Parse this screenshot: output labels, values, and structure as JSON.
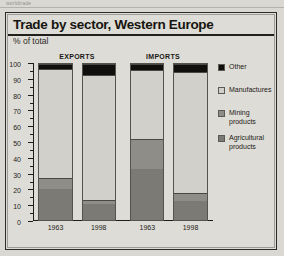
{
  "page": {
    "top_fragment": "worldtrade"
  },
  "figure": {
    "title": "Trade by sector, Western Europe",
    "subtitle": "% of total"
  },
  "groups": [
    {
      "name": "exports",
      "label": "EXPORTS"
    },
    {
      "name": "imports",
      "label": "IMPORTS"
    }
  ],
  "legend": [
    {
      "label": "Other",
      "color": "#100f0d"
    },
    {
      "label": "Manufactures",
      "color": "#d2d0ca"
    },
    {
      "label": "Mining products",
      "color": "#8f8d87"
    },
    {
      "label": "Agricultural products",
      "color": "#7c7a74"
    }
  ],
  "axis": {
    "y_labels": [
      "100",
      "90",
      "80",
      "70",
      "60",
      "50",
      "40",
      "30",
      "20",
      "10",
      "0"
    ],
    "y_label_values": [
      100,
      90,
      80,
      70,
      60,
      50,
      40,
      30,
      20,
      10,
      0
    ]
  },
  "chart_data": {
    "type": "bar",
    "subtype": "stacked-column-100",
    "title": "Trade by sector, Western Europe",
    "subtitle": "% of total",
    "xlabel": "",
    "ylabel": "% of total",
    "ylim": [
      0,
      100
    ],
    "ytick_step": 10,
    "yminor_step": 5,
    "grid": false,
    "legend_position": "right",
    "group_labels": [
      "EXPORTS",
      "IMPORTS"
    ],
    "categories": [
      "1963",
      "1998",
      "1963",
      "1998"
    ],
    "category_groups": [
      "EXPORTS",
      "EXPORTS",
      "IMPORTS",
      "IMPORTS"
    ],
    "series": [
      {
        "name": "Agricultural products",
        "color": "#7c7a74",
        "values": [
          20,
          10,
          33,
          12
        ]
      },
      {
        "name": "Mining products",
        "color": "#8f8d87",
        "values": [
          7,
          3,
          19,
          5
        ]
      },
      {
        "name": "Manufactures",
        "color": "#d2d0ca",
        "values": [
          70,
          80,
          44,
          78
        ]
      },
      {
        "name": "Other",
        "color": "#100f0d",
        "values": [
          3,
          7,
          4,
          5
        ]
      }
    ],
    "stack_order_bottom_to_top": [
      "Agricultural products",
      "Mining products",
      "Manufactures",
      "Other"
    ],
    "bars": [
      {
        "group": "EXPORTS",
        "category": "1963",
        "segments": [
          {
            "name": "Agricultural products",
            "from": 0,
            "to": 20,
            "value": 20,
            "color": "#7c7a74"
          },
          {
            "name": "Mining products",
            "from": 20,
            "to": 27,
            "value": 7,
            "color": "#8f8d87"
          },
          {
            "name": "Manufactures",
            "from": 27,
            "to": 97,
            "value": 70,
            "color": "#d2d0ca"
          },
          {
            "name": "Other",
            "from": 97,
            "to": 100,
            "value": 3,
            "color": "#100f0d"
          }
        ]
      },
      {
        "group": "EXPORTS",
        "category": "1998",
        "segments": [
          {
            "name": "Agricultural products",
            "from": 0,
            "to": 10,
            "value": 10,
            "color": "#7c7a74"
          },
          {
            "name": "Mining products",
            "from": 10,
            "to": 13,
            "value": 3,
            "color": "#8f8d87"
          },
          {
            "name": "Manufactures",
            "from": 13,
            "to": 93,
            "value": 80,
            "color": "#d2d0ca"
          },
          {
            "name": "Other",
            "from": 93,
            "to": 100,
            "value": 7,
            "color": "#100f0d"
          }
        ]
      },
      {
        "group": "IMPORTS",
        "category": "1963",
        "segments": [
          {
            "name": "Agricultural products",
            "from": 0,
            "to": 33,
            "value": 33,
            "color": "#7c7a74"
          },
          {
            "name": "Mining products",
            "from": 33,
            "to": 52,
            "value": 19,
            "color": "#8f8d87"
          },
          {
            "name": "Manufactures",
            "from": 52,
            "to": 96,
            "value": 44,
            "color": "#d2d0ca"
          },
          {
            "name": "Other",
            "from": 96,
            "to": 100,
            "value": 4,
            "color": "#100f0d"
          }
        ]
      },
      {
        "group": "IMPORTS",
        "category": "1998",
        "segments": [
          {
            "name": "Agricultural products",
            "from": 0,
            "to": 12,
            "value": 12,
            "color": "#7c7a74"
          },
          {
            "name": "Mining products",
            "from": 12,
            "to": 17,
            "value": 5,
            "color": "#8f8d87"
          },
          {
            "name": "Manufactures",
            "from": 17,
            "to": 95,
            "value": 78,
            "color": "#d2d0ca"
          },
          {
            "name": "Other",
            "from": 95,
            "to": 100,
            "value": 5,
            "color": "#100f0d"
          }
        ]
      }
    ]
  },
  "layout": {
    "bar_left_pct": [
      3,
      27,
      54,
      78
    ],
    "bar_width_pct": 19
  }
}
